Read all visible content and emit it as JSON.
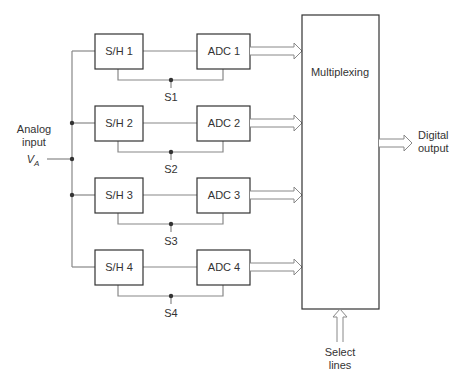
{
  "diagram": {
    "input_label": {
      "line1": "Analog",
      "line2": "input",
      "symbol": "V",
      "subscript": "A"
    },
    "channels": [
      {
        "sh": "S/H 1",
        "adc": "ADC 1",
        "switch": "S1"
      },
      {
        "sh": "S/H 2",
        "adc": "ADC 2",
        "switch": "S2"
      },
      {
        "sh": "S/H 3",
        "adc": "ADC 3",
        "switch": "S3"
      },
      {
        "sh": "S/H 4",
        "adc": "ADC 4",
        "switch": "S4"
      }
    ],
    "mux_label": "Multiplexing",
    "output_label": {
      "line1": "Digital",
      "line2": "output"
    },
    "select_label": {
      "line1": "Select",
      "line2": "lines"
    },
    "colors": {
      "stroke": "#333333",
      "wire": "#888888",
      "background": "#ffffff"
    }
  }
}
